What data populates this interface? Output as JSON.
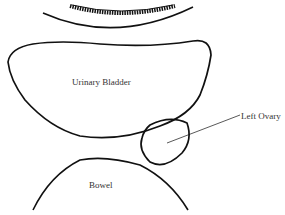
{
  "diagram": {
    "type": "anatomical-sketch",
    "structures": [
      {
        "id": "uterus-hatched-band",
        "label": ""
      },
      {
        "id": "urinary-bladder",
        "label": "Urinary Bladder"
      },
      {
        "id": "left-ovary",
        "label": "Left Ovary"
      },
      {
        "id": "bowel",
        "label": "Bowel"
      }
    ],
    "labels": {
      "bladder": "Urinary Bladder",
      "ovary": "Left Ovary",
      "bowel": "Bowel"
    },
    "colors": {
      "stroke": "#111111",
      "text": "#333333",
      "background": "#ffffff"
    }
  }
}
